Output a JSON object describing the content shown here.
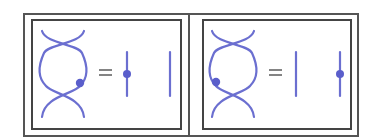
{
  "colors": {
    "strand": "#6b6fd0",
    "dot": "#5a5ecb",
    "border": "#4a4a4a",
    "equals": "#666666"
  },
  "panels": [
    {
      "id": "left",
      "equation": "=",
      "braid_dot_position": "right strand, lower loop",
      "rhs": [
        {
          "strand": 1,
          "has_dot": true
        },
        {
          "strand": 2,
          "has_dot": false
        }
      ]
    },
    {
      "id": "right",
      "equation": "=",
      "braid_dot_position": "left strand, lower loop",
      "rhs": [
        {
          "strand": 1,
          "has_dot": false
        },
        {
          "strand": 2,
          "has_dot": true
        }
      ]
    }
  ]
}
